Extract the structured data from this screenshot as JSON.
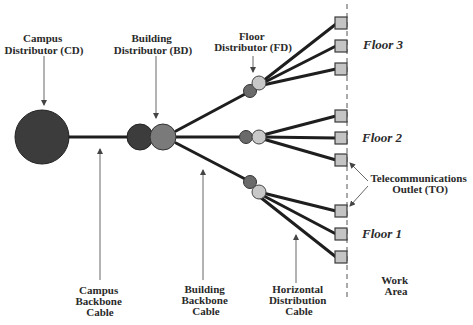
{
  "labels": {
    "campus_distributor": [
      "Campus",
      "Distributor (CD)"
    ],
    "building_distributor": [
      "Building",
      "Distributor (BD)"
    ],
    "floor_distributor": [
      "Floor",
      "Distributor (FD)"
    ],
    "campus_backbone": [
      "Campus",
      "Backbone",
      "Cable"
    ],
    "building_backbone": [
      "Building",
      "Backbone",
      "Cable"
    ],
    "horizontal_distribution": [
      "Horizontal",
      "Distribution",
      "Cable"
    ],
    "telecom_outlet": [
      "Telecommunications",
      "Outlet (TO)"
    ],
    "work_area": [
      "Work",
      "Area"
    ]
  },
  "floors": [
    {
      "name": "Floor 3",
      "outlets": 3
    },
    {
      "name": "Floor 2",
      "outlets": 3
    },
    {
      "name": "Floor 1",
      "outlets": 3
    }
  ],
  "colors": {
    "campus_distributor": "#3c3c3c",
    "building_distributor_dark": "#3c3c3c",
    "building_distributor_light": "#7a7a7a",
    "floor_distributor_dark": "#6a6a6a",
    "floor_distributor_light": "#c8c8c8",
    "outlet_fill": "#c4c4c4",
    "cable": "#1e1e1e"
  }
}
